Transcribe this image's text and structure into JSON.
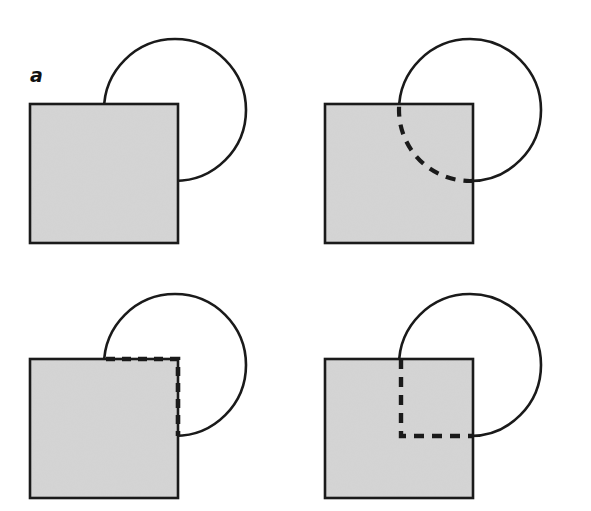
{
  "figure": {
    "background_color": "#ffffff",
    "width": 591,
    "height": 511
  },
  "style": {
    "square_fill": "#d4d4d4",
    "stroke_color": "#1a1a1a",
    "solid_stroke_width": 2.6,
    "dashed_stroke_width": 4.2,
    "dash_pattern": "10 8",
    "noise_opacity": 0.1
  },
  "panels": [
    {
      "id": "a",
      "label": "a",
      "description": "Opaque gray square overlapping a circle; circle is occluded, no hidden contour drawn.",
      "square": {
        "x": 30,
        "y": 104,
        "width": 148,
        "height": 139
      },
      "circle": {
        "cx": 175,
        "cy": 110,
        "r": 71
      },
      "hidden_contour": "none"
    },
    {
      "id": "b",
      "label": "b",
      "description": "Same configuration with the occluded circular arc drawn as a dashed curve inside the square (amodal completion).",
      "square": {
        "x": 30,
        "y": 104,
        "width": 148,
        "height": 139
      },
      "circle": {
        "cx": 175,
        "cy": 110,
        "r": 71
      },
      "hidden_contour": "dashed-arc"
    },
    {
      "id": "c",
      "label": "c",
      "description": "Same configuration with dashed lines tracing the square's own top and right edges within the circle's region.",
      "square": {
        "x": 30,
        "y": 104,
        "width": 148,
        "height": 139
      },
      "circle": {
        "cx": 175,
        "cy": 110,
        "r": 71
      },
      "hidden_contour": "dashed-square-edges"
    },
    {
      "id": "d",
      "label": "d",
      "description": "Same configuration with an L-shaped dashed contour inside the square (vertical then horizontal) meeting the circle.",
      "square": {
        "x": 30,
        "y": 104,
        "width": 148,
        "height": 139
      },
      "circle": {
        "cx": 175,
        "cy": 110,
        "r": 71
      },
      "hidden_contour": "dashed-L-corner"
    }
  ]
}
